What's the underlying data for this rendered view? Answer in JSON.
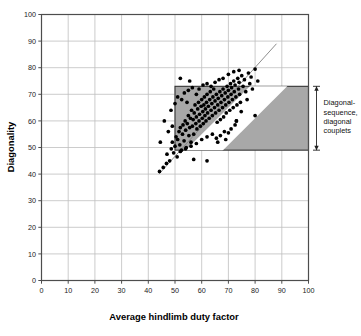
{
  "chart_data": {
    "type": "scatter",
    "title": "",
    "xlabel": "Average hindlimb duty factor",
    "ylabel": "Diagonality",
    "xlim": [
      0,
      100
    ],
    "ylim": [
      0,
      100
    ],
    "xticks": [
      0,
      10,
      20,
      30,
      40,
      50,
      60,
      70,
      80,
      90,
      100
    ],
    "yticks": [
      0,
      10,
      20,
      30,
      40,
      50,
      60,
      70,
      80,
      90,
      100
    ],
    "xtick_labels": [
      "0",
      "10",
      "20",
      "30",
      "40",
      "50",
      "60",
      "70",
      "80",
      "90",
      "100"
    ],
    "ytick_labels": [
      "0",
      "10",
      "20",
      "30",
      "40",
      "50",
      "60",
      "70",
      "80",
      "90",
      "100"
    ],
    "grid": true,
    "legend": "none",
    "marker": "filled-circle",
    "marker_color": "#000000",
    "plot_border_color": "#4d4d4d",
    "grid_color": "#bfbfbf",
    "shaded_region": {
      "label": "Diagonal-sequence, diagonal couplets",
      "x0": 50,
      "x1": 100,
      "y0": 49,
      "y1": 73,
      "fill": "#a8a8a8",
      "border": "#333333"
    },
    "white_band": {
      "description": "unshaded diagonal corridor through shaded region",
      "lower_intercept": -19,
      "upper_intercept": -5,
      "slope": 1.0,
      "fill": "#ffffff"
    },
    "reference_line": {
      "description": "diagonal reference line",
      "x_start": 44,
      "y_start": 40,
      "x_end": 88,
      "y_end": 89,
      "color": "#808080"
    },
    "annotation": {
      "text_lines": [
        "Diagonal-",
        "sequence,",
        "diagonal",
        "couplets"
      ],
      "bracket_top": 73,
      "bracket_bottom": 49,
      "bracket_x": 103
    },
    "points": [
      [
        44.2,
        41.0
      ],
      [
        45.6,
        42.5
      ],
      [
        46.8,
        44.0
      ],
      [
        47.0,
        47.5
      ],
      [
        48.0,
        45.0
      ],
      [
        48.6,
        49.5
      ],
      [
        49.0,
        52.0
      ],
      [
        49.5,
        48.0
      ],
      [
        50.0,
        50.5
      ],
      [
        50.4,
        54.0
      ],
      [
        50.8,
        46.5
      ],
      [
        51.0,
        53.0
      ],
      [
        51.5,
        56.0
      ],
      [
        51.8,
        51.0
      ],
      [
        52.0,
        57.5
      ],
      [
        52.4,
        49.0
      ],
      [
        52.8,
        55.0
      ],
      [
        53.0,
        58.5
      ],
      [
        53.4,
        52.5
      ],
      [
        53.8,
        60.0
      ],
      [
        54.0,
        56.5
      ],
      [
        54.2,
        50.0
      ],
      [
        54.6,
        59.0
      ],
      [
        55.0,
        62.0
      ],
      [
        55.2,
        54.5
      ],
      [
        55.5,
        57.5
      ],
      [
        55.8,
        61.0
      ],
      [
        56.0,
        52.0
      ],
      [
        56.2,
        64.0
      ],
      [
        56.5,
        58.0
      ],
      [
        56.8,
        60.5
      ],
      [
        57.0,
        55.0
      ],
      [
        57.2,
        63.0
      ],
      [
        57.5,
        66.0
      ],
      [
        57.8,
        59.0
      ],
      [
        58.0,
        61.5
      ],
      [
        58.2,
        57.0
      ],
      [
        58.5,
        64.5
      ],
      [
        58.8,
        67.0
      ],
      [
        59.0,
        60.0
      ],
      [
        59.2,
        62.5
      ],
      [
        59.5,
        58.0
      ],
      [
        59.8,
        65.5
      ],
      [
        60.0,
        68.0
      ],
      [
        60.2,
        61.0
      ],
      [
        60.4,
        63.5
      ],
      [
        60.6,
        59.0
      ],
      [
        60.8,
        66.0
      ],
      [
        61.0,
        69.0
      ],
      [
        61.2,
        62.0
      ],
      [
        61.4,
        64.5
      ],
      [
        61.6,
        60.0
      ],
      [
        61.8,
        67.0
      ],
      [
        62.0,
        70.0
      ],
      [
        62.2,
        63.0
      ],
      [
        62.5,
        65.5
      ],
      [
        62.8,
        61.0
      ],
      [
        63.0,
        68.0
      ],
      [
        63.2,
        71.0
      ],
      [
        63.5,
        64.0
      ],
      [
        63.8,
        66.5
      ],
      [
        64.0,
        62.0
      ],
      [
        64.2,
        69.0
      ],
      [
        64.5,
        72.0
      ],
      [
        64.8,
        65.0
      ],
      [
        65.0,
        67.5
      ],
      [
        65.2,
        63.0
      ],
      [
        65.5,
        70.0
      ],
      [
        65.8,
        59.5
      ],
      [
        66.0,
        66.0
      ],
      [
        66.2,
        68.5
      ],
      [
        66.5,
        64.0
      ],
      [
        66.8,
        71.0
      ],
      [
        67.0,
        60.5
      ],
      [
        67.2,
        67.0
      ],
      [
        67.5,
        69.5
      ],
      [
        67.8,
        65.0
      ],
      [
        68.0,
        72.0
      ],
      [
        68.2,
        61.5
      ],
      [
        68.5,
        68.0
      ],
      [
        68.8,
        70.5
      ],
      [
        69.0,
        66.0
      ],
      [
        69.2,
        63.0
      ],
      [
        69.5,
        73.0
      ],
      [
        69.8,
        69.0
      ],
      [
        70.0,
        71.5
      ],
      [
        70.2,
        67.0
      ],
      [
        70.5,
        64.0
      ],
      [
        70.8,
        74.0
      ],
      [
        71.0,
        70.0
      ],
      [
        71.2,
        72.5
      ],
      [
        71.5,
        68.0
      ],
      [
        71.8,
        65.0
      ],
      [
        72.0,
        75.0
      ],
      [
        72.2,
        71.0
      ],
      [
        72.5,
        73.5
      ],
      [
        72.8,
        69.0
      ],
      [
        73.0,
        60.0
      ],
      [
        73.2,
        66.0
      ],
      [
        73.5,
        76.0
      ],
      [
        73.8,
        72.0
      ],
      [
        74.0,
        74.5
      ],
      [
        74.2,
        70.0
      ],
      [
        74.5,
        67.0
      ],
      [
        74.8,
        63.5
      ],
      [
        75.0,
        77.0
      ],
      [
        75.5,
        73.0
      ],
      [
        76.0,
        75.5
      ],
      [
        76.5,
        71.0
      ],
      [
        77.0,
        68.0
      ],
      [
        77.5,
        78.0
      ],
      [
        78.0,
        74.0
      ],
      [
        78.5,
        76.5
      ],
      [
        79.0,
        72.0
      ],
      [
        80.0,
        79.5
      ],
      [
        81.0,
        75.0
      ],
      [
        46.0,
        60.0
      ],
      [
        48.5,
        64.0
      ],
      [
        50.0,
        66.5
      ],
      [
        51.0,
        69.0
      ],
      [
        52.5,
        68.0
      ],
      [
        53.5,
        70.5
      ],
      [
        54.5,
        67.0
      ],
      [
        49.0,
        58.0
      ],
      [
        47.5,
        56.0
      ],
      [
        55.0,
        71.5
      ],
      [
        56.5,
        72.5
      ],
      [
        58.0,
        70.0
      ],
      [
        59.0,
        72.0
      ],
      [
        60.5,
        73.5
      ],
      [
        62.0,
        74.0
      ],
      [
        63.5,
        73.0
      ],
      [
        65.0,
        74.5
      ],
      [
        66.5,
        75.5
      ],
      [
        68.0,
        76.0
      ],
      [
        70.0,
        77.5
      ],
      [
        72.0,
        78.5
      ],
      [
        74.0,
        79.0
      ],
      [
        64.0,
        55.0
      ],
      [
        65.5,
        53.5
      ],
      [
        67.0,
        54.5
      ],
      [
        68.5,
        56.0
      ],
      [
        70.0,
        55.5
      ],
      [
        71.0,
        57.0
      ],
      [
        72.5,
        58.5
      ],
      [
        66.0,
        52.0
      ],
      [
        69.0,
        53.0
      ],
      [
        62.0,
        54.0
      ],
      [
        60.0,
        53.0
      ],
      [
        58.0,
        51.5
      ],
      [
        56.0,
        50.5
      ],
      [
        54.0,
        49.5
      ],
      [
        52.0,
        48.5
      ],
      [
        57.0,
        45.5
      ],
      [
        62.0,
        45.0
      ],
      [
        44.5,
        52.0
      ],
      [
        73.0,
        60.0
      ],
      [
        80.0,
        62.0
      ],
      [
        52.0,
        76.0
      ],
      [
        55.5,
        75.0
      ]
    ]
  },
  "axes": {
    "x_title": "Average hindlimb duty factor",
    "y_title": "Diagonality"
  }
}
